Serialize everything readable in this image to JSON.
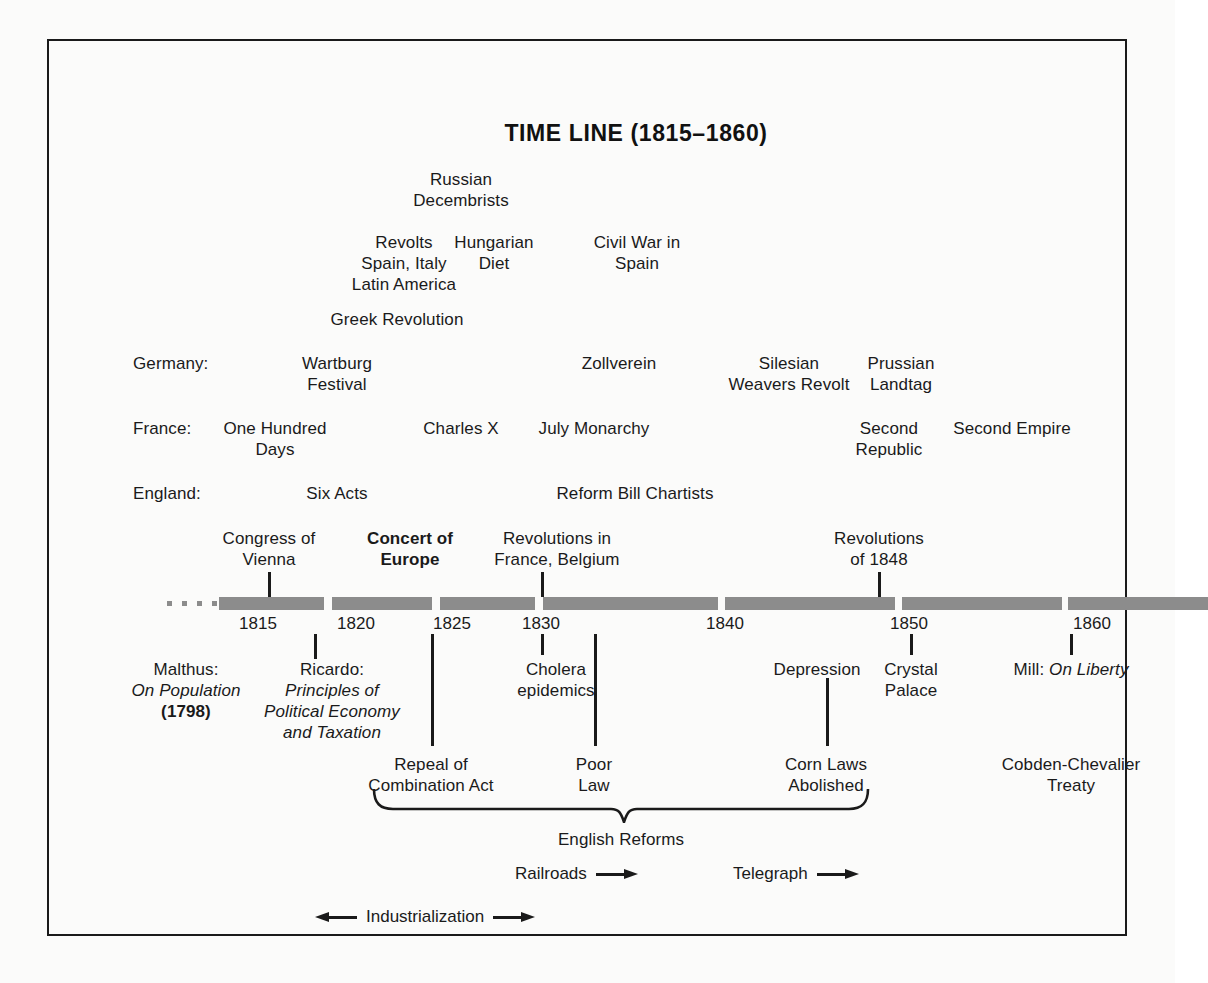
{
  "title": "TIME LINE (1815–1860)",
  "frame": {
    "border_color": "#1a1a1a",
    "background": "#fbfbfa"
  },
  "bar": {
    "color": "#8c8c8c"
  },
  "upper_events": [
    {
      "id": "russian-decembrists",
      "lines": [
        "Russian",
        "Decembrists"
      ],
      "x": 412,
      "y": 128
    },
    {
      "id": "revolts-spain-italy-latin-america",
      "lines": [
        "Revolts",
        "Spain, Italy",
        "Latin America"
      ],
      "x": 355,
      "y": 191
    },
    {
      "id": "hungarian-diet",
      "lines": [
        "Hungarian",
        "Diet"
      ],
      "x": 445,
      "y": 191
    },
    {
      "id": "civil-war-in-spain",
      "lines": [
        "Civil War in",
        "Spain"
      ],
      "x": 588,
      "y": 191
    },
    {
      "id": "greek-revolution",
      "lines": [
        "Greek Revolution"
      ],
      "x": 348,
      "y": 268
    }
  ],
  "country_rows": [
    {
      "id": "germany",
      "label": "Germany:",
      "label_x": 84,
      "y": 312,
      "events": [
        {
          "id": "wartburg-festival",
          "lines": [
            "Wartburg",
            "Festival"
          ],
          "x": 288
        },
        {
          "id": "zollverein",
          "lines": [
            "Zollverein"
          ],
          "x": 570
        },
        {
          "id": "silesian-weavers-revolt",
          "lines": [
            "Silesian",
            "Weavers Revolt"
          ],
          "x": 740
        },
        {
          "id": "prussian-landtag",
          "lines": [
            "Prussian",
            "Landtag"
          ],
          "x": 852
        }
      ]
    },
    {
      "id": "france",
      "label": "France:",
      "label_x": 84,
      "y": 377,
      "events": [
        {
          "id": "one-hundred-days",
          "lines": [
            "One Hundred",
            "Days"
          ],
          "x": 226
        },
        {
          "id": "charles-x",
          "lines": [
            "Charles X"
          ],
          "x": 412
        },
        {
          "id": "july-monarchy",
          "lines": [
            "July Monarchy"
          ],
          "x": 545
        },
        {
          "id": "second-republic",
          "lines": [
            "Second",
            "Republic"
          ],
          "x": 840
        },
        {
          "id": "second-empire",
          "lines": [
            "Second Empire"
          ],
          "x": 963
        }
      ]
    },
    {
      "id": "england",
      "label": "England:",
      "label_x": 84,
      "y": 442,
      "events": [
        {
          "id": "six-acts",
          "lines": [
            "Six Acts"
          ],
          "x": 288
        },
        {
          "id": "reform-bill-chartists",
          "lines": [
            "Reform Bill Chartists"
          ],
          "x": 586
        }
      ]
    }
  ],
  "above_axis_events": [
    {
      "id": "congress-of-vienna",
      "lines": [
        "Congress of",
        "Vienna"
      ],
      "x": 220,
      "y": 487,
      "tick_x": 219,
      "tick_top": 531,
      "tick_h": 25,
      "bold": false
    },
    {
      "id": "concert-of-europe",
      "lines": [
        "Concert of",
        "Europe"
      ],
      "x": 361,
      "y": 487,
      "tick_x": 0,
      "tick_top": 0,
      "tick_h": 0,
      "bold": true
    },
    {
      "id": "revolutions-in-france-belgium",
      "lines": [
        "Revolutions in",
        "France, Belgium"
      ],
      "x": 508,
      "y": 487,
      "tick_x": 492,
      "tick_top": 531,
      "tick_h": 25,
      "bold": false
    },
    {
      "id": "revolutions-of-1848",
      "lines": [
        "Revolutions",
        "of 1848"
      ],
      "x": 830,
      "y": 487,
      "tick_x": 829,
      "tick_top": 531,
      "tick_h": 25,
      "bold": false
    }
  ],
  "years": [
    {
      "label": "1815",
      "x": 209
    },
    {
      "label": "1820",
      "x": 307
    },
    {
      "label": "1825",
      "x": 403
    },
    {
      "label": "1830",
      "x": 492
    },
    {
      "label": "1840",
      "x": 676
    },
    {
      "label": "1850",
      "x": 860
    },
    {
      "label": "1860",
      "x": 1043
    }
  ],
  "below_axis_events": [
    {
      "id": "malthus-on-population",
      "x": 137,
      "y": 618,
      "lines": [
        {
          "text": "Malthus:",
          "style": "normal"
        },
        {
          "text": "On Population",
          "style": "italic"
        },
        {
          "text": "(1798)",
          "style": "bold"
        }
      ]
    },
    {
      "id": "ricardo-principles",
      "x": 283,
      "y": 618,
      "tick_x": 265,
      "tick_top": 593,
      "tick_h": 25,
      "lines": [
        {
          "text": "Ricardo:",
          "style": "normal"
        },
        {
          "text": "Principles of",
          "style": "italic"
        },
        {
          "text": "Political Economy",
          "style": "italic"
        },
        {
          "text": "and Taxation",
          "style": "italic"
        }
      ]
    },
    {
      "id": "cholera-epidemics",
      "x": 507,
      "y": 618,
      "tick_x": 492,
      "tick_top": 593,
      "tick_h": 21,
      "lines": [
        {
          "text": "Cholera",
          "style": "normal"
        },
        {
          "text": "epidemics",
          "style": "normal"
        }
      ]
    },
    {
      "id": "depression",
      "x": 768,
      "y": 618,
      "tick_x": 0,
      "tick_top": 0,
      "tick_h": 0,
      "lines": [
        {
          "text": "Depression",
          "style": "normal"
        }
      ]
    },
    {
      "id": "crystal-palace",
      "x": 862,
      "y": 618,
      "tick_x": 861,
      "tick_top": 593,
      "tick_h": 21,
      "lines": [
        {
          "text": "Crystal",
          "style": "normal"
        },
        {
          "text": "Palace",
          "style": "normal"
        }
      ]
    },
    {
      "id": "mill-on-liberty",
      "x": 1022,
      "y": 618,
      "tick_x": 1021,
      "tick_top": 593,
      "tick_h": 21,
      "lines": [
        {
          "text": "Mill: <i>On Liberty</i>",
          "style": "html"
        }
      ]
    }
  ],
  "reform_events": [
    {
      "id": "repeal-of-combination-act",
      "lines": [
        "Repeal of",
        "Combination Act"
      ],
      "x": 382,
      "y": 713
    },
    {
      "id": "poor-law",
      "lines": [
        "Poor",
        "Law"
      ],
      "x": 545,
      "y": 713
    },
    {
      "id": "corn-laws-abolished",
      "lines": [
        "Corn Laws",
        "Abolished"
      ],
      "x": 777,
      "y": 713
    },
    {
      "id": "cobden-chevalier-treaty",
      "lines": [
        "Cobden-Chevalier",
        "Treaty"
      ],
      "x": 1022,
      "y": 713
    }
  ],
  "connector_lines": [
    {
      "id": "repeal-connector",
      "x": 382,
      "top": 593,
      "height": 112
    },
    {
      "id": "poor-law-connector",
      "x": 545,
      "top": 593,
      "height": 112
    },
    {
      "id": "corn-laws-connector",
      "x": 777,
      "top": 637,
      "height": 68
    }
  ],
  "brace": {
    "id": "english-reforms-brace",
    "label": "English Reforms",
    "label_x": 572,
    "label_y": 788,
    "left_x": 322,
    "right_x": 822,
    "top": 748
  },
  "arrow_rows": [
    {
      "id": "railroads",
      "label": "Railroads",
      "x": 466,
      "y": 823,
      "left_arrow": false,
      "right_arrow": true
    },
    {
      "id": "telegraph",
      "label": "Telegraph",
      "x": 684,
      "y": 823,
      "left_arrow": false,
      "right_arrow": true
    },
    {
      "id": "industrialization",
      "label": "Industrialization",
      "x": 266,
      "y": 866,
      "left_arrow": true,
      "right_arrow": true
    }
  ]
}
